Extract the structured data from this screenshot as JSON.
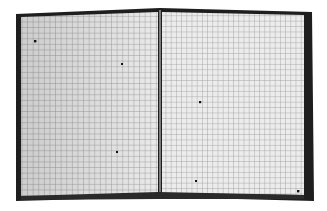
{
  "image": {
    "description": "Grayscale photo of a folded checkerboard-style calibration grid with small dot markers",
    "background": "#ffffff",
    "frame_color": "#1e1e1e",
    "grid_fill": "#e6e6e6",
    "grid_line": "#9a9a9a",
    "marker_color": "#111111",
    "left_panel": [
      [
        20,
        16
      ],
      [
        160,
        10
      ],
      [
        160,
        195
      ],
      [
        20,
        198
      ]
    ],
    "right_panel": [
      [
        160,
        10
      ],
      [
        308,
        14
      ],
      [
        308,
        198
      ],
      [
        160,
        195
      ]
    ],
    "markers": [
      [
        35,
        41
      ],
      [
        122,
        64
      ],
      [
        200,
        102
      ],
      [
        117,
        152
      ],
      [
        196,
        181
      ],
      [
        298,
        191
      ]
    ]
  }
}
